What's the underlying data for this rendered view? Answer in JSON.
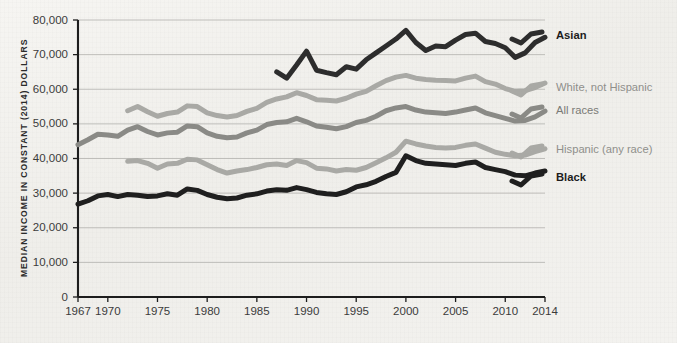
{
  "chart_data": {
    "type": "line",
    "title": "",
    "xlabel": "",
    "ylabel": "MEDIAN INCOME IN CONSTANT (2014) DOLLARS",
    "xlim": [
      1967,
      2014
    ],
    "ylim": [
      0,
      80000
    ],
    "grid": true,
    "legend_position": "right",
    "y_ticks": [
      0,
      10000,
      20000,
      30000,
      40000,
      50000,
      60000,
      70000,
      80000
    ],
    "y_tick_labels": [
      "0",
      "10,000",
      "20,000",
      "30,000",
      "40,000",
      "50,000",
      "60,000",
      "70,000",
      "80,000"
    ],
    "x_ticks": [
      1967,
      1970,
      1975,
      1980,
      1985,
      1990,
      1995,
      2000,
      2005,
      2010,
      2014
    ],
    "x_tick_labels": [
      "1967",
      "1970",
      "1975",
      "1980",
      "1985",
      "1990",
      "1995",
      "2000",
      "2005",
      "2010",
      "2014"
    ],
    "series": [
      {
        "name": "Asian",
        "color": "#2d2d2d",
        "label_color": "#1c1c1c",
        "label_bold": true,
        "stroke_width": 5.0,
        "label_y": 36,
        "x": [
          1987,
          1988,
          1989,
          1990,
          1991,
          1992,
          1993,
          1994,
          1995,
          1996,
          1997,
          1998,
          1999,
          2000,
          2001,
          2002,
          2003,
          2004,
          2005,
          2006,
          2007,
          2008,
          2009,
          2010,
          2011,
          2012,
          2013,
          2014
        ],
        "values": [
          65000,
          63200,
          67000,
          71000,
          65500,
          64800,
          64200,
          66500,
          65800,
          68500,
          70500,
          72500,
          74500,
          77000,
          73500,
          71200,
          72500,
          72300,
          74200,
          75800,
          76200,
          73800,
          73200,
          72000,
          69200,
          70500,
          73500,
          75000
        ]
      },
      {
        "name": "White, not Hispanic",
        "color": "#a9a9a5",
        "label_color": "#8f8f8b",
        "label_bold": false,
        "stroke_width": 5.0,
        "label_y": 88,
        "x": [
          1972,
          1973,
          1974,
          1975,
          1976,
          1977,
          1978,
          1979,
          1980,
          1981,
          1982,
          1983,
          1984,
          1985,
          1986,
          1987,
          1988,
          1989,
          1990,
          1991,
          1992,
          1993,
          1994,
          1995,
          1996,
          1997,
          1998,
          1999,
          2000,
          2001,
          2002,
          2003,
          2004,
          2005,
          2006,
          2007,
          2008,
          2009,
          2010,
          2011,
          2012,
          2013,
          2014
        ],
        "values": [
          53800,
          55000,
          53500,
          52200,
          53000,
          53400,
          55200,
          55000,
          53200,
          52400,
          52000,
          52400,
          53600,
          54500,
          56200,
          57200,
          57800,
          59000,
          58200,
          57000,
          56800,
          56600,
          57400,
          58600,
          59400,
          61000,
          62500,
          63500,
          64000,
          63200,
          62800,
          62600,
          62500,
          62400,
          63200,
          63800,
          62200,
          61500,
          60200,
          59400,
          59600,
          60500,
          61800
        ]
      },
      {
        "name": "All races",
        "color": "#8a8a86",
        "label_color": "#7a7a76",
        "label_bold": false,
        "stroke_width": 5.0,
        "label_y": 111,
        "x": [
          1967,
          1968,
          1969,
          1970,
          1971,
          1972,
          1973,
          1974,
          1975,
          1976,
          1977,
          1978,
          1979,
          1980,
          1981,
          1982,
          1983,
          1984,
          1985,
          1986,
          1987,
          1988,
          1989,
          1990,
          1991,
          1992,
          1993,
          1994,
          1995,
          1996,
          1997,
          1998,
          1999,
          2000,
          2001,
          2002,
          2003,
          2004,
          2005,
          2006,
          2007,
          2008,
          2009,
          2010,
          2011,
          2012,
          2013,
          2014
        ],
        "values": [
          44000,
          45400,
          47000,
          46800,
          46400,
          48200,
          49200,
          47800,
          46800,
          47400,
          47600,
          49400,
          49200,
          47400,
          46400,
          46000,
          46200,
          47400,
          48200,
          49800,
          50400,
          50600,
          51600,
          50600,
          49400,
          49000,
          48600,
          49200,
          50400,
          51000,
          52200,
          53800,
          54600,
          55000,
          54000,
          53400,
          53200,
          53000,
          53400,
          54000,
          54600,
          53200,
          52400,
          51600,
          50800,
          51000,
          52000,
          53700
        ]
      },
      {
        "name": "Hispanic (any race)",
        "color": "#a9a9a5",
        "label_color": "#8f8f8b",
        "label_bold": false,
        "stroke_width": 5.0,
        "label_y": 150,
        "x": [
          1972,
          1973,
          1974,
          1975,
          1976,
          1977,
          1978,
          1979,
          1980,
          1981,
          1982,
          1983,
          1984,
          1985,
          1986,
          1987,
          1988,
          1989,
          1990,
          1991,
          1992,
          1993,
          1994,
          1995,
          1996,
          1997,
          1998,
          1999,
          2000,
          2001,
          2002,
          2003,
          2004,
          2005,
          2006,
          2007,
          2008,
          2009,
          2010,
          2011,
          2012,
          2013,
          2014
        ],
        "values": [
          39200,
          39400,
          38600,
          37200,
          38400,
          38600,
          39800,
          39600,
          38200,
          36800,
          35800,
          36400,
          36800,
          37400,
          38200,
          38400,
          38000,
          39400,
          38800,
          37200,
          37000,
          36400,
          36800,
          36600,
          37400,
          38800,
          40200,
          41800,
          45000,
          44200,
          43600,
          43200,
          43000,
          43200,
          43800,
          44200,
          43000,
          41800,
          41200,
          40800,
          41000,
          42000,
          42800
        ]
      },
      {
        "name": "Black",
        "color": "#1f1f1f",
        "label_color": "#1c1c1c",
        "label_bold": true,
        "stroke_width": 5.0,
        "label_y": 178,
        "x": [
          1967,
          1968,
          1969,
          1970,
          1971,
          1972,
          1973,
          1974,
          1975,
          1976,
          1977,
          1978,
          1979,
          1980,
          1981,
          1982,
          1983,
          1984,
          1985,
          1986,
          1987,
          1988,
          1989,
          1990,
          1991,
          1992,
          1993,
          1994,
          1995,
          1996,
          1997,
          1998,
          1999,
          2000,
          2001,
          2002,
          2003,
          2004,
          2005,
          2006,
          2007,
          2008,
          2009,
          2010,
          2011,
          2012,
          2013,
          2014
        ],
        "values": [
          26800,
          27800,
          29200,
          29600,
          29000,
          29600,
          29400,
          29000,
          29200,
          29800,
          29400,
          31200,
          30800,
          29600,
          28800,
          28400,
          28600,
          29400,
          29800,
          30600,
          31000,
          30800,
          31600,
          31000,
          30200,
          29800,
          29600,
          30400,
          31800,
          32400,
          33400,
          34800,
          36000,
          40800,
          39400,
          38600,
          38400,
          38200,
          38000,
          38600,
          39000,
          37400,
          36800,
          36200,
          35200,
          35000,
          35800,
          36400
        ]
      }
    ]
  }
}
